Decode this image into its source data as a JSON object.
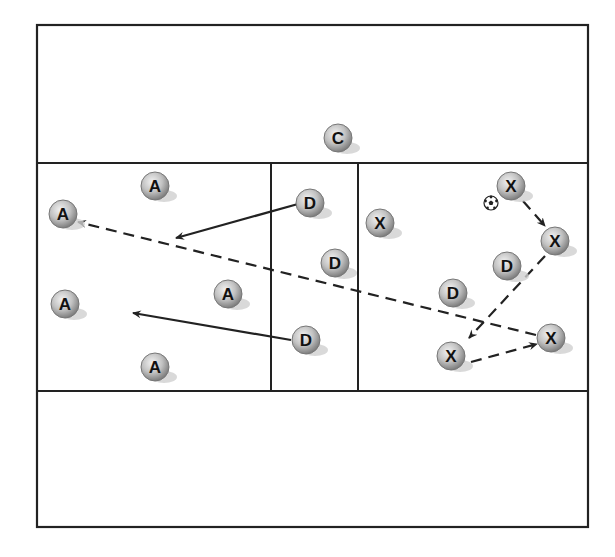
{
  "diagram": {
    "colors": {
      "line": "#222222",
      "player_fill_light": "#e6e6e6",
      "player_fill_dark": "#8a8a8a",
      "player_stroke": "#777777",
      "shadow": "#cfcfcf",
      "label": "#111111"
    },
    "field": {
      "outer": {
        "x": 37,
        "y": 25,
        "w": 551,
        "h": 502
      },
      "h_lines": [
        163,
        391
      ],
      "v_lines": [
        271,
        358
      ]
    },
    "players": [
      {
        "id": "c1",
        "label": "C",
        "team": "coach",
        "x": 338,
        "y": 138
      },
      {
        "id": "a1",
        "label": "A",
        "team": "attack",
        "x": 155,
        "y": 186
      },
      {
        "id": "a2",
        "label": "A",
        "team": "attack",
        "x": 63,
        "y": 214
      },
      {
        "id": "a3",
        "label": "A",
        "team": "attack",
        "x": 228,
        "y": 294
      },
      {
        "id": "a4",
        "label": "A",
        "team": "attack",
        "x": 65,
        "y": 304
      },
      {
        "id": "a5",
        "label": "A",
        "team": "attack",
        "x": 155,
        "y": 367
      },
      {
        "id": "d1",
        "label": "D",
        "team": "defense",
        "x": 310,
        "y": 203
      },
      {
        "id": "d2",
        "label": "D",
        "team": "defense",
        "x": 335,
        "y": 263
      },
      {
        "id": "d3",
        "label": "D",
        "team": "defense",
        "x": 306,
        "y": 340
      },
      {
        "id": "d4",
        "label": "D",
        "team": "defense",
        "x": 453,
        "y": 293
      },
      {
        "id": "d5",
        "label": "D",
        "team": "defense",
        "x": 507,
        "y": 266
      },
      {
        "id": "x1",
        "label": "X",
        "team": "x",
        "x": 380,
        "y": 223
      },
      {
        "id": "x2",
        "label": "X",
        "team": "x",
        "x": 511,
        "y": 186
      },
      {
        "id": "x3",
        "label": "X",
        "team": "x",
        "x": 555,
        "y": 241
      },
      {
        "id": "x4",
        "label": "X",
        "team": "x",
        "x": 551,
        "y": 338
      },
      {
        "id": "x5",
        "label": "X",
        "team": "x",
        "x": 451,
        "y": 356
      }
    ],
    "ball": {
      "x": 491,
      "y": 203,
      "icon": "soccer-ball-icon"
    },
    "arrows": [
      {
        "id": "run-d1",
        "type": "solid",
        "from": [
          298,
          204
        ],
        "to": [
          176,
          238
        ]
      },
      {
        "id": "run-d3",
        "type": "solid",
        "from": [
          291,
          340
        ],
        "to": [
          133,
          313
        ]
      },
      {
        "id": "pass-x2-x3",
        "type": "dashed",
        "from": [
          523,
          201
        ],
        "to": [
          545,
          226
        ]
      },
      {
        "id": "pass-x3-x5",
        "type": "dashed",
        "from": [
          545,
          256
        ],
        "to": [
          469,
          338
        ]
      },
      {
        "id": "pass-x5-x4",
        "type": "dashed",
        "from": [
          471,
          362
        ],
        "to": [
          537,
          344
        ]
      },
      {
        "id": "pass-x4-a2",
        "type": "dashed",
        "from": [
          536,
          335
        ],
        "to": [
          78,
          222
        ]
      }
    ]
  }
}
